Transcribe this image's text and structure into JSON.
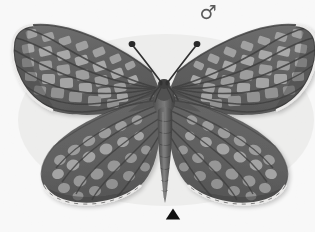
{
  "figure": {
    "kind": "specimen-photograph",
    "view": "dorsal",
    "color_mode": "grayscale",
    "background_color": "#fdfdfc"
  },
  "annotations": {
    "sex_symbol": {
      "glyph": "♂",
      "meaning": "male",
      "icon_name": "male-sex-symbol-icon",
      "color": "#5a5a5a"
    },
    "position_marker": {
      "shape": "triangle-up",
      "icon_name": "triangle-up-marker-icon",
      "color": "#101010"
    },
    "caption": {
      "text": "",
      "color": "#fbfbfb"
    }
  },
  "palette": {
    "wing_dark": "#4a4a4a",
    "wing_mid": "#6d6d6d",
    "wing_light": "#9d9d9d",
    "wing_pale": "#b9b9b9",
    "vein_dark": "#3a3a3a",
    "fringe_white": "#f0efee",
    "body_dark": "#3f3f3f",
    "antenna": "#2f2f2f",
    "shadow": "#d8d8d6"
  },
  "morphology": {
    "forewing_span_px": 298,
    "wing_top_px": 23,
    "hindwing_bottom_px": 205,
    "body_axis_x_px": 164,
    "antenna_count": 2,
    "antenna_tip": "clubbed"
  }
}
